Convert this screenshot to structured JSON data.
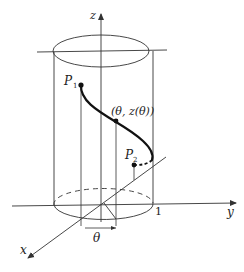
{
  "diagram": {
    "type": "3d-cylinder-curve",
    "axes": {
      "z_label": "z",
      "y_label": "y",
      "x_label": "x"
    },
    "labels": {
      "p1": "P",
      "p1_sub": "1",
      "p2": "P",
      "p2_sub": "2",
      "curve_point": "(θ, z(θ))",
      "unit_radius": "1",
      "angle": "θ"
    },
    "colors": {
      "line": "#333333",
      "curve": "#111111",
      "background": "#ffffff"
    }
  }
}
